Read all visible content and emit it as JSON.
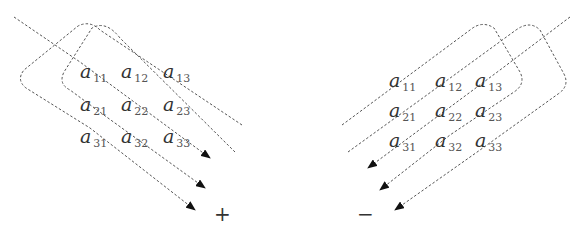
{
  "diagram": {
    "left": {
      "sign": "+",
      "matrix": [
        [
          "a",
          "11"
        ],
        [
          "a",
          "12"
        ],
        [
          "a",
          "13"
        ],
        [
          "a",
          "21"
        ],
        [
          "a",
          "22"
        ],
        [
          "a",
          "23"
        ],
        [
          "a",
          "31"
        ],
        [
          "a",
          "32"
        ],
        [
          "a",
          "33"
        ]
      ]
    },
    "right": {
      "sign": "−",
      "matrix": [
        [
          "a",
          "11"
        ],
        [
          "a",
          "12"
        ],
        [
          "a",
          "13"
        ],
        [
          "a",
          "21"
        ],
        [
          "a",
          "22"
        ],
        [
          "a",
          "23"
        ],
        [
          "a",
          "31"
        ],
        [
          "a",
          "32"
        ],
        [
          "a",
          "33"
        ]
      ]
    },
    "labels": {
      "l11": "11",
      "l12": "12",
      "l13": "13",
      "l21": "21",
      "l22": "22",
      "l23": "23",
      "l31": "31",
      "l32": "32",
      "l33": "33",
      "plus": "+",
      "minus": "−",
      "a": "a"
    }
  }
}
